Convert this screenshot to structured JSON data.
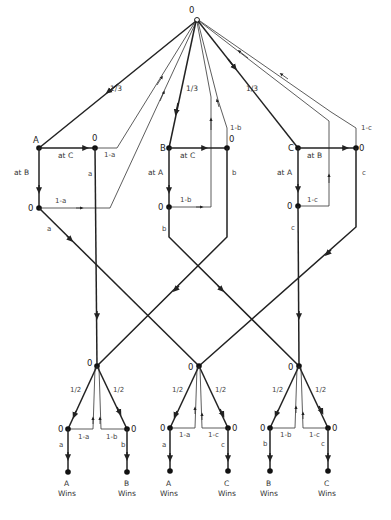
{
  "diagram": {
    "root": {
      "label": "0"
    },
    "top_branches": [
      {
        "player": "A",
        "probability": "1/3"
      },
      {
        "player": "B",
        "probability": "1/3"
      },
      {
        "player": "C",
        "probability": "1/3"
      }
    ],
    "first_level": {
      "A": {
        "label": "A",
        "shoot_right": "at C",
        "shoot_down": "at B",
        "right_node": "0",
        "down_node": "0",
        "miss_right": "1-a",
        "miss_down": "1-a",
        "hit_right": "a",
        "hit_down": "a"
      },
      "B": {
        "label": "B",
        "shoot_right": "at C",
        "shoot_down": "at A",
        "right_node": "0",
        "down_node": "0",
        "miss_right": "1-b",
        "miss_down": "1-b",
        "hit_right": "b",
        "hit_down": "b"
      },
      "C": {
        "label": "C",
        "shoot_right": "at B",
        "shoot_down": "at A",
        "right_node": "0",
        "down_node": "0",
        "miss_right": "1-c",
        "miss_down": "1-c",
        "hit_right": "c",
        "hit_down": "c"
      }
    },
    "duel_nodes": [
      {
        "label": "0",
        "left_prob": "1/2",
        "right_prob": "1/2",
        "left": {
          "node": "0",
          "miss": "1-a",
          "hit": "a",
          "winner": "A",
          "wins": "Wins"
        },
        "right": {
          "node": "0",
          "miss": "1-b",
          "hit": "b",
          "winner": "B",
          "wins": "Wins"
        }
      },
      {
        "label": "0",
        "left_prob": "1/2",
        "right_prob": "1/2",
        "left": {
          "node": "0",
          "miss": "1-a",
          "hit": "a",
          "winner": "A",
          "wins": "Wins"
        },
        "right": {
          "node": "0",
          "miss": "1-c",
          "hit": "c",
          "winner": "C",
          "wins": "Wins"
        }
      },
      {
        "label": "0",
        "left_prob": "1/2",
        "right_prob": "1/2",
        "left": {
          "node": "0",
          "miss": "1-b",
          "hit": "b",
          "winner": "B",
          "wins": "Wins"
        },
        "right": {
          "node": "0",
          "miss": "1-c",
          "hit": "c",
          "winner": "C",
          "wins": "Wins"
        }
      }
    ]
  }
}
